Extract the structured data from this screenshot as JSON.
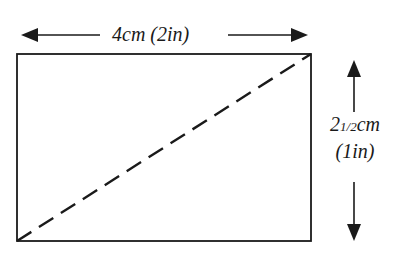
{
  "diagram": {
    "width_label": "4cm (2in)",
    "height_label_whole": "2",
    "height_label_fraction": "1/2",
    "height_label_unit": "cm",
    "height_label_alt": "(1in)",
    "colors": {
      "stroke": "#1a1a1a",
      "background": "#ffffff"
    },
    "rectangle": {
      "x": 17,
      "y": 54,
      "width": 294,
      "height": 187
    },
    "diagonal": {
      "style": "dashed",
      "from": "bottom-left",
      "to": "top-right"
    }
  }
}
